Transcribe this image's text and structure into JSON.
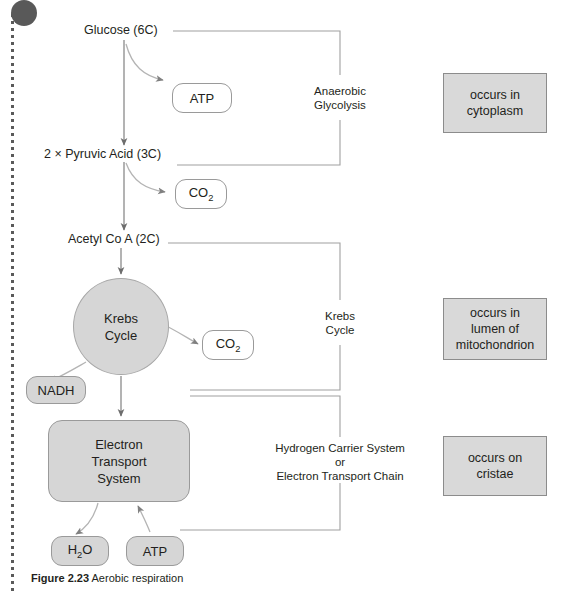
{
  "figure": {
    "caption_number": "Figure 2.23",
    "caption_text": "Aerobic respiration"
  },
  "pathway": {
    "glucose": "Glucose (6C)",
    "pyruvic_acid": "2 × Pyruvic Acid (3C)",
    "acetyl_coa": "Acetyl Co A (2C)",
    "krebs_line1": "Krebs",
    "krebs_line2": "Cycle",
    "ets_line1": "Electron",
    "ets_line2": "Transport",
    "ets_line3": "System"
  },
  "products": {
    "atp_glycolysis": "ATP",
    "co2_pyruvate": "CO",
    "co2_pyruvate_sub": "2",
    "co2_krebs": "CO",
    "co2_krebs_sub": "2",
    "nadh": "NADH",
    "water": "H",
    "water_sub": "2",
    "water_tail": "O",
    "atp_ets": "ATP"
  },
  "brackets": [
    {
      "line1": "Anaerobic",
      "line2": "Glycolysis"
    },
    {
      "line1": "Krebs",
      "line2": "Cycle"
    },
    {
      "line1": "Hydrogen Carrier System",
      "line2": "or",
      "line3": "Electron Transport Chain"
    }
  ],
  "locations": [
    {
      "line1": "occurs in",
      "line2": "cytoplasm"
    },
    {
      "line1": "occurs in",
      "line2": "lumen of",
      "line3": "mitochondrion"
    },
    {
      "line1": "occurs on",
      "line2": "cristae"
    }
  ],
  "colors": {
    "fill_gray": "#d6d6d6",
    "box_gray": "#d9d9d9",
    "stroke_gray": "#9a9a9a",
    "text": "#231f20",
    "rail": "#595959"
  }
}
